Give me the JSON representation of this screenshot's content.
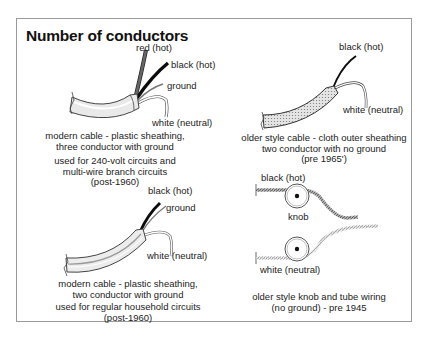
{
  "title": "Number of conductors",
  "panels": [
    {
      "id": "modern-3-conductor",
      "wire_labels": [
        "red (hot)",
        "black (hot)",
        "ground",
        "white (neutral)"
      ],
      "caption_lines": [
        "modern cable - plastic sheathing,",
        "three conductor with ground"
      ],
      "usage_lines": [
        "used for 240-volt circuits and",
        "multi-wire branch circuits",
        "(post-1960)"
      ]
    },
    {
      "id": "older-cloth-2-conductor",
      "wire_labels": [
        "black (hot)",
        "white (neutral)"
      ],
      "caption_lines": [
        "older style cable - cloth outer sheathing",
        "two conductor with no ground",
        "(pre 1965')"
      ]
    },
    {
      "id": "modern-2-conductor",
      "wire_labels": [
        "black (hot)",
        "ground",
        "white (neutral)"
      ],
      "caption_lines": [
        "modern cable - plastic sheathing,",
        "two conductor with ground"
      ],
      "usage_lines": [
        "used for regular household circuits",
        "(post-1960)"
      ]
    },
    {
      "id": "knob-and-tube",
      "wire_labels": [
        "black (hot)",
        "knob",
        "white (neutral)"
      ],
      "caption_lines": [
        "older style knob and tube wiring",
        "(no ground) - pre 1945"
      ]
    }
  ],
  "colors": {
    "frame": "#9a9a9a",
    "black_wire": "#111111",
    "red_wire": "#555555",
    "ground_wire": "#777777",
    "white_wire": "#ffffff",
    "sheath": "#e8e8e8",
    "cloth": "#d8d8d8"
  }
}
